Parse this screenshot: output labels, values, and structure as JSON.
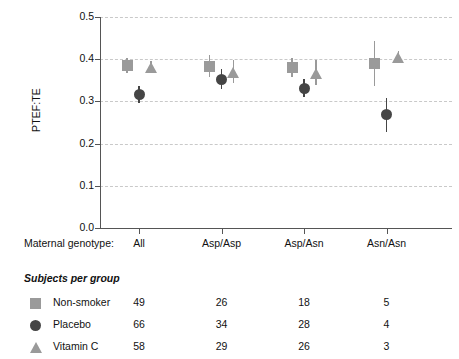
{
  "chart_data": {
    "type": "scatter",
    "title": "",
    "xlabel": "Maternal genotype:",
    "ylabel": "PTEF:TE",
    "ylim": [
      0.0,
      0.5
    ],
    "yticks": [
      "0.0",
      "0.1",
      "0.2",
      "0.3",
      "0.4",
      "0.5"
    ],
    "grid": "horizontal-dashed",
    "legend_position": "below-table",
    "categories": [
      "All",
      "Asp/Asp",
      "Asp/Asn",
      "Asn/Asn"
    ],
    "series": [
      {
        "name": "Non-smoker",
        "marker": "square",
        "color": "#9a9a9a",
        "values": [
          0.386,
          0.383,
          0.38,
          0.39
        ],
        "err_low": [
          0.368,
          0.357,
          0.358,
          0.337
        ],
        "err_high": [
          0.404,
          0.41,
          0.404,
          0.443
        ]
      },
      {
        "name": "Placebo",
        "marker": "circle",
        "color": "#454545",
        "values": [
          0.317,
          0.353,
          0.331,
          0.268
        ],
        "err_low": [
          0.297,
          0.33,
          0.31,
          0.228
        ],
        "err_high": [
          0.337,
          0.376,
          0.352,
          0.308
        ]
      },
      {
        "name": "Vitamin C",
        "marker": "triangle",
        "color": "#9a9a9a",
        "values": [
          0.381,
          0.369,
          0.367,
          0.405
        ],
        "err_low": [
          0.368,
          0.344,
          0.34,
          0.392
        ],
        "err_high": [
          0.396,
          0.397,
          0.399,
          0.42
        ]
      }
    ]
  },
  "axis": {
    "ylabel": "PTEF:TE",
    "yticks": [
      "0.5",
      "0.4",
      "0.3",
      "0.2",
      "0.1",
      "0.0"
    ],
    "xlabel_prefix": "Maternal genotype:",
    "xcategories": [
      "All",
      "Asp/Asp",
      "Asp/Asn",
      "Asn/Asn"
    ]
  },
  "table": {
    "title": "Subjects per group",
    "rows": [
      {
        "marker": "square",
        "color": "#9a9a9a",
        "label": "Non-smoker",
        "counts": [
          "49",
          "26",
          "18",
          "5"
        ]
      },
      {
        "marker": "circle",
        "color": "#454545",
        "label": "Placebo",
        "counts": [
          "66",
          "34",
          "28",
          "4"
        ]
      },
      {
        "marker": "triangle",
        "color": "#9a9a9a",
        "label": "Vitamin C",
        "counts": [
          "58",
          "29",
          "26",
          "3"
        ]
      }
    ]
  },
  "colors": {
    "non_smoker": "#9a9a9a",
    "placebo": "#454545",
    "vitamin_c": "#9a9a9a",
    "grid": "#c9c9c9",
    "axis": "#555555",
    "text": "#111111"
  }
}
